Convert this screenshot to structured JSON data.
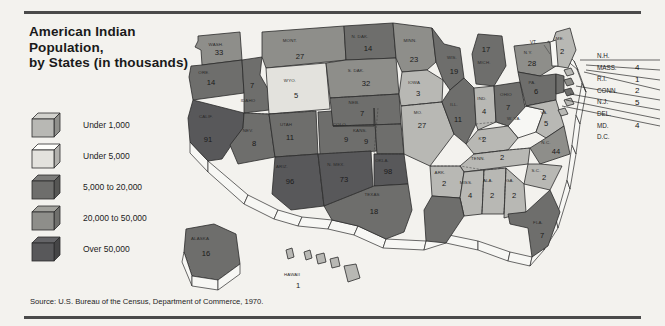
{
  "title": "American Indian\nPopulation,\nby States (in thousands)",
  "title_lines": [
    "American Indian",
    "Population,",
    "by States (in thousands)"
  ],
  "source": "Source: U.S. Bureau of the Census, Department of Commerce, 1970.",
  "colors": {
    "background": "#f3f2ee",
    "rule": "#4a4a4a",
    "tier1": "#b8b8b4",
    "tier2": "#e3e2dd",
    "tier3": "#6e6e6c",
    "tier4": "#8e8e8a",
    "tier5": "#58585a",
    "outline": "#2b2b2b",
    "white": "#f7f7f4"
  },
  "legend": {
    "items": [
      {
        "label": "Under 1,000",
        "color": "#b8b8b4",
        "swatch": "cube-under-1000"
      },
      {
        "label": "Under 5,000",
        "color": "#e3e2dd",
        "swatch": "cube-under-5000"
      },
      {
        "label": "5,000 to 20,000",
        "color": "#6e6e6c",
        "swatch": "cube-5000-20000"
      },
      {
        "label": "20,000 to 50,000",
        "color": "#8e8e8a",
        "swatch": "cube-20000-50000"
      },
      {
        "label": "Over 50,000",
        "color": "#58585a",
        "swatch": "cube-over-50000"
      }
    ]
  },
  "callouts": [
    {
      "name": "N.H.",
      "value": ""
    },
    {
      "name": "MASS.",
      "value": "4"
    },
    {
      "name": "R.I.",
      "value": "1"
    },
    {
      "name": "CONN.",
      "value": "2"
    },
    {
      "name": "N.J.",
      "value": "5"
    },
    {
      "name": "DEL.",
      "value": ""
    },
    {
      "name": "MD.",
      "value": "4"
    },
    {
      "name": "D.C.",
      "value": ""
    }
  ],
  "map": {
    "vt_label": "VT.",
    "states": [
      {
        "abbr": "WASH.",
        "value": "33",
        "tier": 4
      },
      {
        "abbr": "ORE.",
        "value": "14",
        "tier": 3
      },
      {
        "abbr": "MONT.",
        "value": "27",
        "tier": 4
      },
      {
        "abbr": "IDAHO",
        "value": "7",
        "tier": 3
      },
      {
        "abbr": "WYO.",
        "value": "5",
        "tier": 2
      },
      {
        "abbr": "N. DAK.",
        "value": "14",
        "tier": 3
      },
      {
        "abbr": "S. DAK.",
        "value": "32",
        "tier": 4
      },
      {
        "abbr": "MINN.",
        "value": "23",
        "tier": 4
      },
      {
        "abbr": "WIS.",
        "value": "19",
        "tier": 3
      },
      {
        "abbr": "MICH.",
        "value": "17",
        "tier": 3
      },
      {
        "abbr": "CALIF.",
        "value": "91",
        "tier": 5
      },
      {
        "abbr": "NEV.",
        "value": "8",
        "tier": 3
      },
      {
        "abbr": "UTAH",
        "value": "11",
        "tier": 3
      },
      {
        "abbr": "COLO.",
        "value": "9",
        "tier": 3
      },
      {
        "abbr": "NEB.",
        "value": "7",
        "tier": 3
      },
      {
        "abbr": "IOWA",
        "value": "3",
        "tier": 1
      },
      {
        "abbr": "ILL.",
        "value": "11",
        "tier": 3
      },
      {
        "abbr": "IND.",
        "value": "4",
        "tier": 1
      },
      {
        "abbr": "OHIO",
        "value": "7",
        "tier": 3
      },
      {
        "abbr": "N.Y.",
        "value": "28",
        "tier": 4
      },
      {
        "abbr": "PA.",
        "value": "6",
        "tier": 3
      },
      {
        "abbr": "ME.",
        "value": "2",
        "tier": 1
      },
      {
        "abbr": "W. VA.",
        "value": "",
        "tier": 0
      },
      {
        "abbr": "VA.",
        "value": "5",
        "tier": 1
      },
      {
        "abbr": "KY.",
        "value": "2",
        "tier": 1
      },
      {
        "abbr": "MO.",
        "value": "27",
        "tier": 1
      },
      {
        "abbr": "KANS.",
        "value": "9",
        "tier": 3
      },
      {
        "abbr": "ARIZ.",
        "value": "96",
        "tier": 5
      },
      {
        "abbr": "N. MEX.",
        "value": "73",
        "tier": 5
      },
      {
        "abbr": "OKLA.",
        "value": "98",
        "tier": 5
      },
      {
        "abbr": "TEXAS",
        "value": "18",
        "tier": 3
      },
      {
        "abbr": "ARK.",
        "value": "2",
        "tier": 1
      },
      {
        "abbr": "LA.",
        "value": "5",
        "tier": 3
      },
      {
        "abbr": "MISS.",
        "value": "4",
        "tier": 1
      },
      {
        "abbr": "ALA.",
        "value": "2",
        "tier": 1
      },
      {
        "abbr": "GA.",
        "value": "2",
        "tier": 1
      },
      {
        "abbr": "TENN.",
        "value": "2",
        "tier": 1
      },
      {
        "abbr": "S.C.",
        "value": "2",
        "tier": 1
      },
      {
        "abbr": "N.C.",
        "value": "44",
        "tier": 4
      },
      {
        "abbr": "FLA.",
        "value": "7",
        "tier": 3
      },
      {
        "abbr": "ALASKA",
        "value": "16",
        "tier": 3
      },
      {
        "abbr": "HAWAII",
        "value": "1",
        "tier": 1
      }
    ]
  },
  "chart_data": {
    "type": "map",
    "title": "American Indian Population, by States (in thousands)",
    "unit": "thousands",
    "source": "U.S. Bureau of the Census, Department of Commerce, 1970.",
    "legend_bins": [
      "Under 1,000",
      "Under 5,000",
      "5,000 to 20,000",
      "20,000 to 50,000",
      "Over 50,000"
    ],
    "values": {
      "WASH.": 33,
      "ORE.": 14,
      "MONT.": 27,
      "IDAHO": 7,
      "WYO.": 5,
      "N. DAK.": 14,
      "S. DAK.": 32,
      "MINN.": 23,
      "WIS.": 19,
      "MICH.": 17,
      "CALIF.": 91,
      "NEV.": 8,
      "UTAH": 11,
      "COLO.": 9,
      "NEB.": 7,
      "IOWA": 3,
      "ILL.": 11,
      "IND.": 4,
      "OHIO": 7,
      "N.Y.": 28,
      "PA.": 6,
      "ME.": 2,
      "VA.": 5,
      "KY.": 2,
      "MO.": 27,
      "KANS.": 9,
      "ARIZ.": 96,
      "N. MEX.": 73,
      "OKLA.": 98,
      "TEXAS": 18,
      "ARK.": 2,
      "LA.": 5,
      "MISS.": 4,
      "ALA.": 2,
      "GA.": 2,
      "TENN.": 2,
      "S.C.": 2,
      "N.C.": 44,
      "FLA.": 7,
      "ALASKA": 16,
      "HAWAII": 1,
      "MASS.": 4,
      "R.I.": 1,
      "CONN.": 2,
      "N.J.": 5,
      "MD.": 4
    }
  }
}
